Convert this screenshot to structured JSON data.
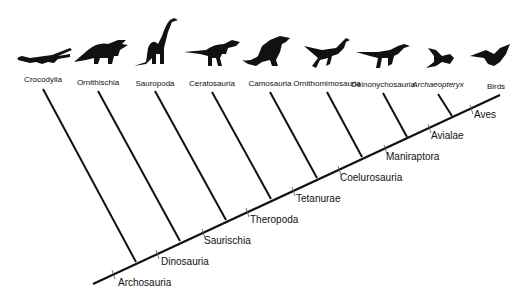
{
  "diagram": {
    "type": "cladogram",
    "header_faint": {
      "left": "",
      "right": ""
    },
    "terminal_taxa": [
      {
        "label": "Crocodylia",
        "x": 43,
        "y": 80,
        "italic": false,
        "icon": "crocodile-silhouette"
      },
      {
        "label": "Ornithischia",
        "x": 98,
        "y": 82,
        "italic": false,
        "icon": "triceratops-silhouette"
      },
      {
        "label": "Sauropoda",
        "x": 155,
        "y": 83,
        "italic": false,
        "icon": "sauropod-silhouette"
      },
      {
        "label": "Ceratosauria",
        "x": 212,
        "y": 83,
        "italic": false,
        "icon": "theropod-silhouette"
      },
      {
        "label": "Camosauria",
        "x": 270,
        "y": 83,
        "italic": false,
        "icon": "allosaur-silhouette"
      },
      {
        "label": "Ornithomimosauria",
        "x": 327,
        "y": 83,
        "italic": false,
        "icon": "ornithomimid-silhouette"
      },
      {
        "label": "Deinonychosauria",
        "x": 383,
        "y": 84,
        "italic": false,
        "icon": "raptor-silhouette"
      },
      {
        "label": "Archaeopteryx",
        "x": 438,
        "y": 84,
        "italic": true,
        "icon": "archaeopteryx-silhouette"
      },
      {
        "label": "Birds",
        "x": 495,
        "y": 86,
        "italic": false,
        "icon": "bird-silhouette"
      }
    ],
    "nodes": [
      {
        "label": "Archosauria",
        "x": 118,
        "y": 280
      },
      {
        "label": "Dinosauria",
        "x": 161,
        "y": 259
      },
      {
        "label": "Saurischia",
        "x": 204,
        "y": 238
      },
      {
        "label": "Theropoda",
        "x": 250,
        "y": 217
      },
      {
        "label": "Tetanurae",
        "x": 296,
        "y": 196
      },
      {
        "label": "Coelurosauria",
        "x": 340,
        "y": 175
      },
      {
        "label": "Maniraptora",
        "x": 386,
        "y": 154
      },
      {
        "label": "Avialae",
        "x": 431,
        "y": 133
      },
      {
        "label": "Aves",
        "x": 474,
        "y": 112
      }
    ]
  }
}
